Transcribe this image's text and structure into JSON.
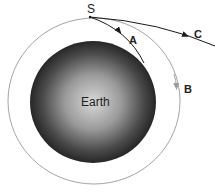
{
  "diagram": {
    "labels": {
      "start": "S",
      "path_a": "A",
      "path_b": "B",
      "path_c": "C",
      "planet": "Earth"
    },
    "colors": {
      "background": "#ffffff",
      "path_a": "#1a1a1a",
      "path_b": "#9a9a9a",
      "path_c": "#1a1a1a",
      "earth_center": "#d8d8d8",
      "earth_edge": "#2a2a2a",
      "text": "#222222"
    },
    "paths": [
      {
        "id": "A",
        "description": "Falls back and hits Earth"
      },
      {
        "id": "B",
        "description": "Circular orbit around Earth"
      },
      {
        "id": "C",
        "description": "Escapes Earth's gravity"
      }
    ]
  }
}
